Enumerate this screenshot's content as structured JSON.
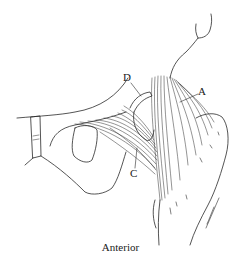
{
  "figure": {
    "view": "Anterior",
    "labels": {
      "a": "A",
      "c": "C",
      "d": "D"
    },
    "caption": "Anterior",
    "line_color": "#2a2a2a",
    "background": "#ffffff"
  }
}
